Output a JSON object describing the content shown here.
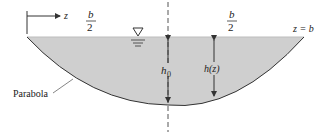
{
  "diagram": {
    "type": "open-channel parabolic cross-section",
    "colors": {
      "water_fill": "#cfcfcf",
      "line": "#333333",
      "text": "#222222",
      "background": "#ffffff"
    },
    "labels": {
      "axis_z": "z",
      "half_width_left_num": "b",
      "half_width_left_den": "2",
      "half_width_right_num": "b",
      "half_width_right_den": "2",
      "right_edge": "z = b",
      "center_depth": "h",
      "center_depth_sub": "0",
      "local_depth": "h(z)",
      "shape_callout": "Parabola"
    },
    "symbols": {
      "free_surface": "free-surface-triangle-icon",
      "centerline": "dashed-centerline"
    }
  }
}
